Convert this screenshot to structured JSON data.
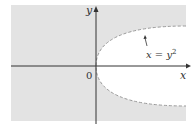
{
  "diagram": {
    "type": "region-plot",
    "equation_label": "x = y",
    "equation_exponent": "2",
    "x_axis_label": "x",
    "y_axis_label": "y",
    "origin_label": "0",
    "region": "shaded region outside parabola x = y^2 (boundary dashed, not included)",
    "colors": {
      "shade": "#e3e3e3",
      "axis": "#333333",
      "boundary": "#9a9a9a",
      "background": "#ffffff"
    }
  }
}
